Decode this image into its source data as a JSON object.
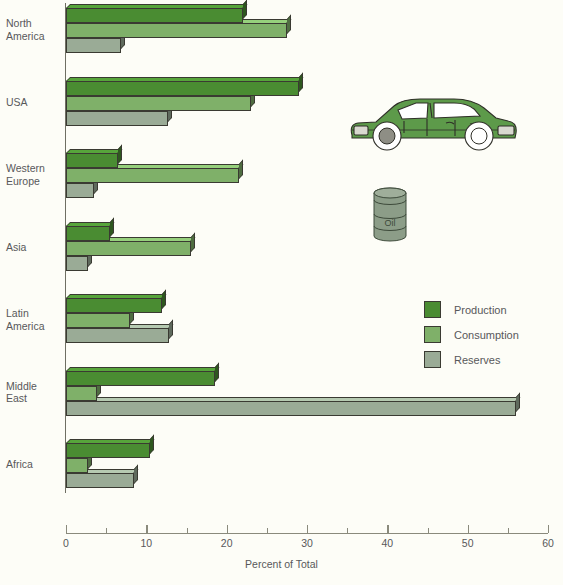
{
  "chart_data": {
    "type": "bar",
    "orientation": "horizontal",
    "title": "",
    "xlabel": "Percent of Total",
    "ylabel": "",
    "xlim": [
      0,
      60
    ],
    "xticks": [
      0,
      10,
      20,
      30,
      40,
      50,
      60
    ],
    "xtick_labels": [
      "0",
      "10",
      "20",
      "30",
      "40",
      "50",
      "60"
    ],
    "minor_tick_step": 5,
    "grid": false,
    "legend_position": "center-right",
    "categories": [
      "North\nAmerica",
      "USA",
      "Western\nEurope",
      "Asia",
      "Latin\nAmerica",
      "Middle\nEast",
      "Africa"
    ],
    "series": [
      {
        "name": "Production",
        "color": "#4a8c32",
        "values": [
          22.0,
          29.0,
          6.5,
          5.5,
          12.0,
          18.5,
          10.5
        ]
      },
      {
        "name": "Consumption",
        "color": "#7fb069",
        "values": [
          27.5,
          23.0,
          21.5,
          15.5,
          8.0,
          3.8,
          2.8
        ]
      },
      {
        "name": "Reserves",
        "color": "#9aab96",
        "values": [
          6.8,
          12.7,
          3.5,
          2.8,
          12.8,
          56.0,
          8.5
        ]
      }
    ]
  },
  "legend": {
    "items": [
      {
        "label": "Production",
        "color": "#4a8c32"
      },
      {
        "label": "Consumption",
        "color": "#7fb069"
      },
      {
        "label": "Reserves",
        "color": "#9aab96"
      }
    ]
  },
  "axis": {
    "title": "Percent of Total"
  },
  "illustrations": {
    "car": {
      "name": "green-sedan-car",
      "body_color": "#5d9a4a"
    },
    "barrel": {
      "name": "oil-barrel",
      "label": "Oil",
      "color": "#8c9d88"
    }
  },
  "colors": {
    "background": "#fdfdf7",
    "text": "#58585a",
    "outline": "#3a3a32",
    "axis": "#8a8a7c"
  }
}
